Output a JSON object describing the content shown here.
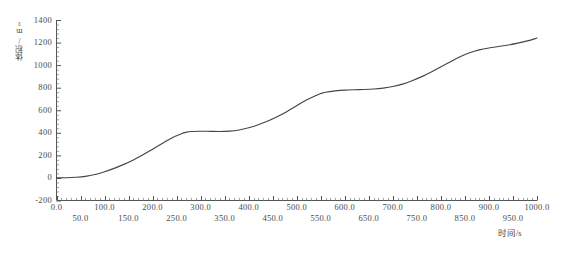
{
  "chart_data": {
    "type": "line",
    "title": "",
    "subtitle": "",
    "xlabel": "时间/s",
    "ylabel": "体积/m³",
    "xlim": [
      0,
      1000
    ],
    "ylim": [
      -200,
      1400
    ],
    "grid": false,
    "legend": null,
    "legend_position": "none",
    "x_major_step": 50,
    "x_minor_step": 10,
    "y_major_step": 200,
    "y_minor_step": 40,
    "x_tick_labels": [
      "0.0",
      "50.0",
      "100.0",
      "150.0",
      "200.0",
      "250.0",
      "300.0",
      "350.0",
      "400.0",
      "450.0",
      "500.0",
      "550.0",
      "600.0",
      "650.0",
      "700.0",
      "750.0",
      "800.0",
      "850.0",
      "900.0",
      "950.0",
      "1000.0"
    ],
    "x_tick_values": [
      0,
      50,
      100,
      150,
      200,
      250,
      300,
      350,
      400,
      450,
      500,
      550,
      600,
      650,
      700,
      750,
      800,
      850,
      900,
      950,
      1000
    ],
    "y_tick_labels": [
      "-200",
      "0",
      "200",
      "400",
      "600",
      "800",
      "1000",
      "1200",
      "1400"
    ],
    "y_tick_values": [
      -200,
      0,
      200,
      400,
      600,
      800,
      1000,
      1200,
      1400
    ],
    "series": [
      {
        "name": "体积",
        "color": "#454545",
        "x": [
          0,
          20,
          40,
          60,
          80,
          100,
          120,
          140,
          160,
          180,
          200,
          220,
          240,
          260,
          270,
          280,
          300,
          320,
          340,
          360,
          380,
          400,
          420,
          440,
          460,
          480,
          500,
          520,
          540,
          550,
          560,
          580,
          600,
          620,
          640,
          660,
          680,
          700,
          720,
          740,
          760,
          780,
          800,
          820,
          840,
          860,
          880,
          900,
          920,
          940,
          960,
          980,
          1000
        ],
        "y": [
          0,
          2,
          6,
          14,
          30,
          55,
          85,
          120,
          160,
          205,
          255,
          305,
          355,
          392,
          405,
          412,
          414,
          413,
          412,
          415,
          425,
          445,
          472,
          505,
          545,
          590,
          640,
          690,
          730,
          748,
          760,
          772,
          779,
          782,
          784,
          788,
          796,
          810,
          832,
          862,
          898,
          940,
          985,
          1030,
          1075,
          1110,
          1135,
          1152,
          1165,
          1178,
          1195,
          1215,
          1240
        ]
      }
    ],
    "notes": {
      "shape": "monotonic staircase S-curve with two plateaus",
      "plateau_1_value": 412,
      "plateau_1_range": [
        260,
        350
      ],
      "plateau_2_value": 782,
      "plateau_2_range": [
        550,
        660
      ],
      "start_value": 0,
      "end_value": 1240
    }
  },
  "axes": {
    "y_title": "体积/m³",
    "x_title": "时间/s"
  }
}
